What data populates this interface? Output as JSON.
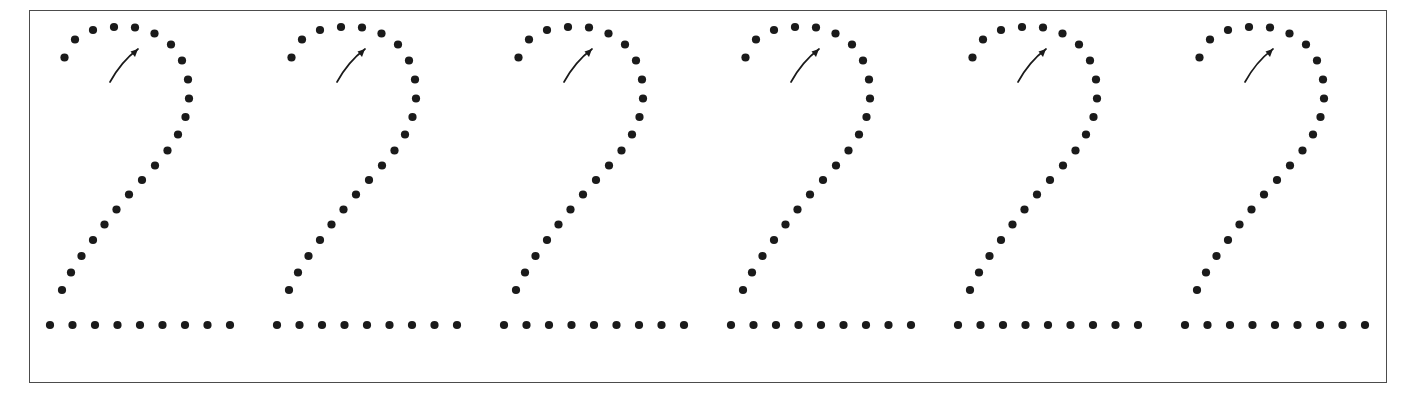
{
  "worksheet": {
    "title": "Number 2 Tracing Practice Row",
    "kind": "handwriting-tracing-worksheet",
    "glyph": "2",
    "repetitions": 6,
    "page": {
      "width": 1417,
      "height": 401,
      "background": "#ffffff"
    },
    "frame": {
      "x": 29,
      "y": 10,
      "width": 1358,
      "height": 373,
      "border_color": "#4c4c4c",
      "border_width": 1.6,
      "fill": "#ffffff"
    },
    "dot": {
      "radius": 4.1,
      "color": "#1a1a1a"
    },
    "arrow": {
      "color": "#1a1a1a",
      "stroke_width": 1.7,
      "label": "start-stroke-direction-arrow",
      "path": "M 0,37 C 6,26 16,13 28,4",
      "head": "M 28,4 L 20.5,6.5 L 25,12 Z",
      "offset": {
        "x": 62,
        "y": 45
      }
    },
    "figure": {
      "pitch": 227.0,
      "first_origin_x": 48.0,
      "origin_y": 0.0,
      "dots": [
        [
          16.5,
          57.5
        ],
        [
          27.0,
          39.5
        ],
        [
          45.0,
          30.0
        ],
        [
          66.0,
          27.0
        ],
        [
          87.0,
          27.5
        ],
        [
          106.5,
          33.5
        ],
        [
          123.0,
          44.5
        ],
        [
          134.0,
          60.5
        ],
        [
          140.0,
          79.5
        ],
        [
          141.0,
          98.5
        ],
        [
          137.5,
          117.0
        ],
        [
          130.0,
          134.5
        ],
        [
          119.5,
          150.5
        ],
        [
          107.0,
          165.5
        ],
        [
          94.0,
          180.0
        ],
        [
          81.0,
          194.5
        ],
        [
          68.5,
          209.5
        ],
        [
          56.5,
          224.5
        ],
        [
          45.0,
          240.0
        ],
        [
          33.5,
          256.0
        ],
        [
          23.0,
          272.5
        ],
        [
          14.0,
          290.0
        ],
        [
          2.0,
          325.0
        ],
        [
          24.5,
          325.0
        ],
        [
          47.0,
          325.0
        ],
        [
          69.5,
          325.0
        ],
        [
          92.0,
          325.0
        ],
        [
          114.5,
          325.0
        ],
        [
          137.0,
          325.0
        ],
        [
          159.5,
          325.0
        ],
        [
          182.0,
          325.0
        ]
      ]
    }
  }
}
